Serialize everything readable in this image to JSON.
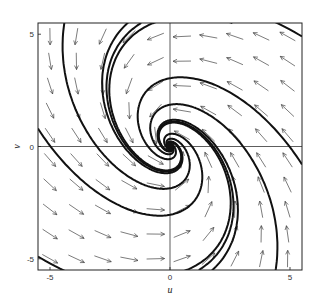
{
  "chart_data": {
    "type": "phase_portrait",
    "title": "",
    "xlabel": "u",
    "ylabel": "v",
    "xlim": [
      -5.5,
      5.5
    ],
    "ylim": [
      -5.5,
      5.5
    ],
    "x_ticks": [
      -5,
      0,
      5
    ],
    "y_ticks": [
      -5,
      0,
      5
    ],
    "x_tick_labels": [
      "-5",
      "0",
      "5"
    ],
    "y_tick_labels": [
      "-5",
      "0",
      "5"
    ],
    "grid": false,
    "zero_axes": true,
    "system": {
      "description": "linear spiral sink: du/dt = a*u + b*v, dv/dt = c*u + d*v",
      "a": -1.0,
      "b": -1.0,
      "c": 1.4,
      "d": -0.2
    },
    "equilibrium": {
      "u": 0,
      "v": 0,
      "type": "stable spiral"
    },
    "direction_field": {
      "spacing": 1.1,
      "arrow_length": 0.75
    },
    "trajectory_starts": [
      [
        -4.4,
        5.5
      ],
      [
        -1.2,
        5.5
      ],
      [
        2.6,
        5.5
      ],
      [
        5.5,
        4.9
      ],
      [
        4.4,
        -5.5
      ],
      [
        1.2,
        -5.5
      ],
      [
        -2.6,
        -5.5
      ],
      [
        -5.5,
        -4.9
      ],
      [
        -5.5,
        0.8
      ],
      [
        5.5,
        -0.8
      ]
    ]
  },
  "axes": {
    "x_label": "u",
    "y_label": "v"
  }
}
